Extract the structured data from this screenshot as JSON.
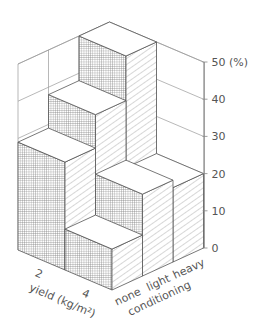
{
  "chart_data": {
    "type": "bar3d",
    "title": "",
    "zlabel": "%",
    "zunit_label": "50 (%)",
    "ztick_labels": [
      "0",
      "10",
      "20",
      "30",
      "40",
      "50 (%)"
    ],
    "zticks": [
      0,
      10,
      20,
      30,
      40,
      50
    ],
    "zlim": [
      0,
      50
    ],
    "x_axis": {
      "label": "yield (kg/m²)",
      "categories": [
        "2",
        "4"
      ]
    },
    "y_axis": {
      "label": "conditioning",
      "categories": [
        "none",
        "light",
        "heavy"
      ]
    },
    "series": [
      {
        "name": "2",
        "values": [
          29,
          38,
          50
        ]
      },
      {
        "name": "4",
        "values": [
          11,
          22,
          20
        ]
      }
    ],
    "grid": true
  },
  "labels": {
    "yield_axis": "yield (kg/m²)",
    "conditioning_axis": "conditioning",
    "yield_ticks": [
      "2",
      "4"
    ],
    "conditioning_ticks": [
      "none",
      "light",
      "heavy"
    ],
    "z_ticks": [
      "0",
      "10",
      "20",
      "30",
      "40",
      "50 (%)"
    ]
  },
  "colors": {
    "line": "#555555",
    "grid": "#999999",
    "hatch": "#666666"
  }
}
